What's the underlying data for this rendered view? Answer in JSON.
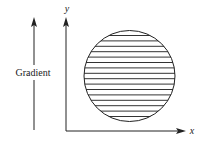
{
  "diagram": {
    "gradient_label": "Gradient",
    "y_axis_label": "y",
    "x_axis_label": "x",
    "circle": {
      "description": "circle filled with horizontal parallel lines",
      "line_count": 16
    },
    "colors": {
      "stroke": "#222222",
      "background": "#ffffff"
    }
  }
}
